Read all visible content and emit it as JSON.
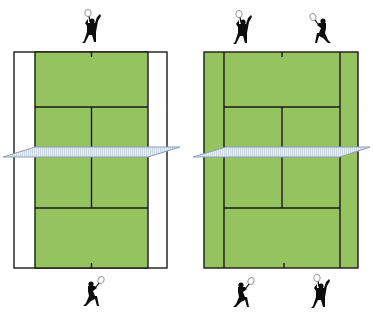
{
  "colors": {
    "background": "#ffffff",
    "court_green": "#94c35f",
    "alley_white": "#ffffff",
    "line": "#1a1a1a",
    "net_fill": "#dde8f2",
    "net_stroke": "#8aa0b8",
    "player": "#0d0d0d"
  },
  "diagrams": [
    {
      "name": "singles",
      "label": "Singles court",
      "players_top": 1,
      "players_bottom": 1,
      "alleys_in_play": false
    },
    {
      "name": "doubles",
      "label": "Doubles court",
      "players_top": 2,
      "players_bottom": 2,
      "alleys_in_play": true
    }
  ]
}
